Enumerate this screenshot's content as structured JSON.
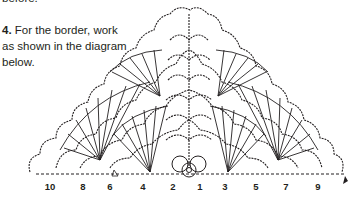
{
  "text": {
    "cut_off_top": "before.",
    "step_number": "4.",
    "instruction": " For the border, work as shown in the diagram below."
  },
  "diagram": {
    "row_labels_left": [
      "10",
      "8",
      "6",
      "4",
      "2"
    ],
    "row_labels_right": [
      "1",
      "3",
      "5",
      "7",
      "9"
    ],
    "labels": [
      {
        "text": "10",
        "x": 50
      },
      {
        "text": "8",
        "x": 83
      },
      {
        "text": "6",
        "x": 110
      },
      {
        "text": "4",
        "x": 143
      },
      {
        "text": "2",
        "x": 173
      },
      {
        "text": "1",
        "x": 200
      },
      {
        "text": "3",
        "x": 225
      },
      {
        "text": "5",
        "x": 256
      },
      {
        "text": "7",
        "x": 286
      },
      {
        "text": "9",
        "x": 318
      }
    ],
    "line_color": "#231f20"
  }
}
